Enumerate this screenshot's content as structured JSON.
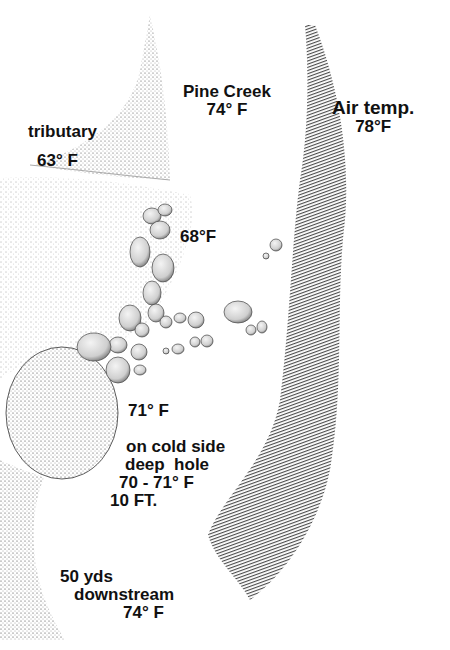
{
  "figure": {
    "type": "stippled stream temperature diagram",
    "colors": {
      "ink": "#111111",
      "background": "#ffffff"
    }
  },
  "labels": {
    "pine_creek": {
      "name": "Pine Creek",
      "temp": "74° F"
    },
    "air_temp": {
      "name": "Air temp.",
      "temp": "78°F"
    },
    "tributary": {
      "name": "tributary",
      "temp": "63° F"
    },
    "boulders": {
      "temp": "68°F"
    },
    "below_boulder": {
      "temp": "71° F"
    },
    "deep_hole": {
      "line1": "on cold side",
      "line2": "deep  hole",
      "line3": "70 - 71° F",
      "line4": "10 FT."
    },
    "downstream": {
      "line1": "50 yds",
      "line2": "downstream",
      "line3": "74° F"
    }
  }
}
